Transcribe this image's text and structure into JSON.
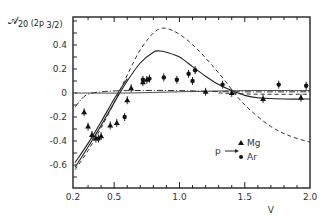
{
  "chart_data": {
    "type": "scatter",
    "ylabel": "A20 (2p 3/2)",
    "xlabel": "V",
    "xlim": [
      0.2,
      2.0
    ],
    "ylim": [
      -0.79,
      0.63
    ],
    "x_ticks": [
      "0.2",
      "0.5",
      "1.0",
      "1.5",
      "2.0"
    ],
    "y_ticks": [
      "0.4",
      "0.2",
      "0",
      "-0.2",
      "-0.4",
      "-0.6"
    ],
    "grid": false,
    "legend": {
      "position": "lower right",
      "prefix": "p",
      "arrow": "→",
      "entries": [
        {
          "marker": "triangle",
          "label": "Mg"
        },
        {
          "marker": "dot",
          "label": "Ar"
        }
      ]
    },
    "series": [
      {
        "name": "Mg",
        "marker": "triangle",
        "points": [
          [
            0.27,
            -0.16
          ],
          [
            0.3,
            -0.28
          ],
          [
            0.33,
            -0.35
          ],
          [
            0.36,
            -0.38
          ],
          [
            0.4,
            -0.36
          ],
          [
            0.47,
            -0.27
          ],
          [
            0.52,
            -0.25
          ],
          [
            0.6,
            -0.06
          ],
          [
            0.63,
            0.04
          ],
          [
            0.72,
            0.09
          ],
          [
            0.75,
            0.11
          ],
          [
            1.2,
            0.01
          ],
          [
            1.4,
            0.0
          ],
          [
            1.64,
            -0.05
          ],
          [
            1.93,
            -0.04
          ]
        ]
      },
      {
        "name": "Ar",
        "marker": "dot",
        "points": [
          [
            0.38,
            -0.38
          ],
          [
            0.58,
            -0.2
          ],
          [
            0.72,
            0.11
          ],
          [
            0.77,
            0.12
          ],
          [
            0.88,
            0.13
          ],
          [
            0.98,
            0.11
          ],
          [
            1.07,
            0.16
          ],
          [
            1.12,
            0.19
          ],
          [
            1.1,
            0.1
          ],
          [
            1.33,
            0.07
          ],
          [
            1.76,
            0.07
          ],
          [
            1.97,
            0.06
          ]
        ]
      },
      {
        "name": "theory-solid",
        "style": "solid",
        "points": [
          [
            0.2,
            -0.62
          ],
          [
            0.3,
            -0.45
          ],
          [
            0.4,
            -0.27
          ],
          [
            0.5,
            -0.08
          ],
          [
            0.6,
            0.1
          ],
          [
            0.7,
            0.25
          ],
          [
            0.8,
            0.34
          ],
          [
            0.85,
            0.35
          ],
          [
            0.9,
            0.34
          ],
          [
            1.0,
            0.3
          ],
          [
            1.1,
            0.22
          ],
          [
            1.2,
            0.14
          ],
          [
            1.3,
            0.07
          ],
          [
            1.4,
            0.02
          ],
          [
            1.5,
            -0.02
          ],
          [
            1.6,
            -0.04
          ],
          [
            1.8,
            -0.05
          ],
          [
            2.0,
            -0.05
          ]
        ]
      },
      {
        "name": "theory-solid-2",
        "style": "solid",
        "points": [
          [
            0.2,
            -0.58
          ],
          [
            0.3,
            -0.42
          ],
          [
            0.4,
            -0.24
          ],
          [
            0.5,
            -0.05
          ],
          [
            0.6,
            0.12
          ]
        ]
      },
      {
        "name": "theory-dashed",
        "style": "dashed",
        "points": [
          [
            0.2,
            -0.64
          ],
          [
            0.3,
            -0.48
          ],
          [
            0.4,
            -0.29
          ],
          [
            0.5,
            -0.08
          ],
          [
            0.6,
            0.15
          ],
          [
            0.7,
            0.36
          ],
          [
            0.8,
            0.5
          ],
          [
            0.87,
            0.54
          ],
          [
            0.95,
            0.52
          ],
          [
            1.05,
            0.45
          ],
          [
            1.15,
            0.35
          ],
          [
            1.25,
            0.23
          ],
          [
            1.35,
            0.1
          ],
          [
            1.45,
            -0.04
          ],
          [
            1.55,
            -0.15
          ],
          [
            1.7,
            -0.28
          ],
          [
            1.85,
            -0.36
          ],
          [
            2.0,
            -0.41
          ]
        ]
      },
      {
        "name": "theory-dashdot",
        "style": "dashdot",
        "points": [
          [
            0.2,
            -0.12
          ],
          [
            0.25,
            -0.05
          ],
          [
            0.3,
            -0.01
          ],
          [
            0.4,
            0.01
          ],
          [
            0.6,
            0.02
          ],
          [
            1.0,
            0.02
          ],
          [
            1.4,
            0.01
          ],
          [
            2.0,
            0.01
          ]
        ]
      },
      {
        "name": "theory-flat-solid",
        "style": "solid-thin",
        "points": [
          [
            0.2,
            0.0
          ],
          [
            0.6,
            0.0
          ],
          [
            1.0,
            0.01
          ],
          [
            1.5,
            0.02
          ],
          [
            2.0,
            0.02
          ]
        ]
      },
      {
        "name": "theory-flat-dashed",
        "style": "dashed",
        "points": [
          [
            1.3,
            0.0
          ],
          [
            1.6,
            -0.01
          ],
          [
            2.0,
            -0.01
          ]
        ]
      }
    ]
  }
}
